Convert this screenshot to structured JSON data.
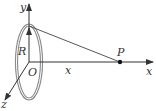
{
  "diagram": {
    "labels": {
      "y_axis": "y",
      "x_axis": "x",
      "z_axis": "z",
      "origin": "O",
      "radius": "R",
      "distance": "x",
      "point": "P"
    },
    "colors": {
      "ring": "#8a8a8a",
      "axes": "#333333",
      "line": "#444444"
    }
  }
}
